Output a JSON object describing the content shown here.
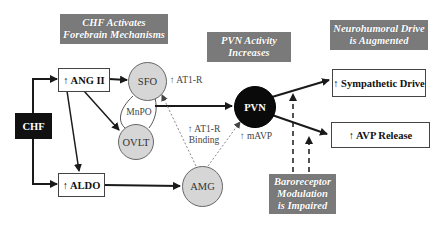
{
  "headers": {
    "forebrain": {
      "line1": "CHF  Activates",
      "line2": "Forebrain Mechanisms"
    },
    "pvn": {
      "line1": "PVN Activity",
      "line2": "Increases"
    },
    "neurohumoral": {
      "line1": "Neurohumoral Drive",
      "line2": "is Augmented"
    },
    "baroreceptor": {
      "line1": "Baroreceptor",
      "line2": "Modulation",
      "line3": "is Impaired"
    }
  },
  "nodes": {
    "chf": "CHF",
    "ang2": "↑ ANG II",
    "aldo": "↑ ALDO",
    "sfo": "SFO",
    "ovlt": "OVLT",
    "amg": "AMG",
    "pvn": "PVN",
    "sympathetic": "↑ Sympathetic Drive",
    "avp": "↑ AVP Release"
  },
  "labels": {
    "mnpo": "MnPO",
    "at1r": "↑ AT1-R",
    "at1r_binding_1": "↑ AT1-R",
    "at1r_binding_2": "Binding",
    "mavp": "↑ mAVP"
  },
  "colors": {
    "header_bg": "#7a7a7a",
    "circle_fill": "#d6d6d6",
    "dark": "#0a0a0a",
    "line": "#1a1a1a",
    "dotted": "#888888"
  }
}
